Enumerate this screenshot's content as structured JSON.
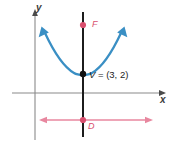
{
  "figure": {
    "axes": {
      "x_label": "x",
      "y_label": "y"
    },
    "labels": {
      "focus": "F",
      "directrix": "D",
      "vertex_name": "V",
      "vertex_equals": " = ",
      "vertex_point": "(3, 2)",
      "vertex_full": "V = (3, 2)"
    },
    "colors": {
      "curve": "#3a8fc4",
      "focus_point": "#d94f6e",
      "directrix_line": "#e8879f",
      "directrix_point": "#d94f6e",
      "axis": "#8a8a8a",
      "axis_of_symmetry": "#1c1c1c",
      "vertex_point": "#111111",
      "background": "#ffffff"
    },
    "geometry": {
      "vertex": [
        3,
        2
      ],
      "focus_marker_y_px": 25,
      "vertex_marker_px": [
        83,
        74
      ],
      "directrix_y_px": 120,
      "axis_of_symmetry_x_px": 83,
      "x_axis_y_px": 93,
      "y_axis_x_px": 35
    }
  }
}
